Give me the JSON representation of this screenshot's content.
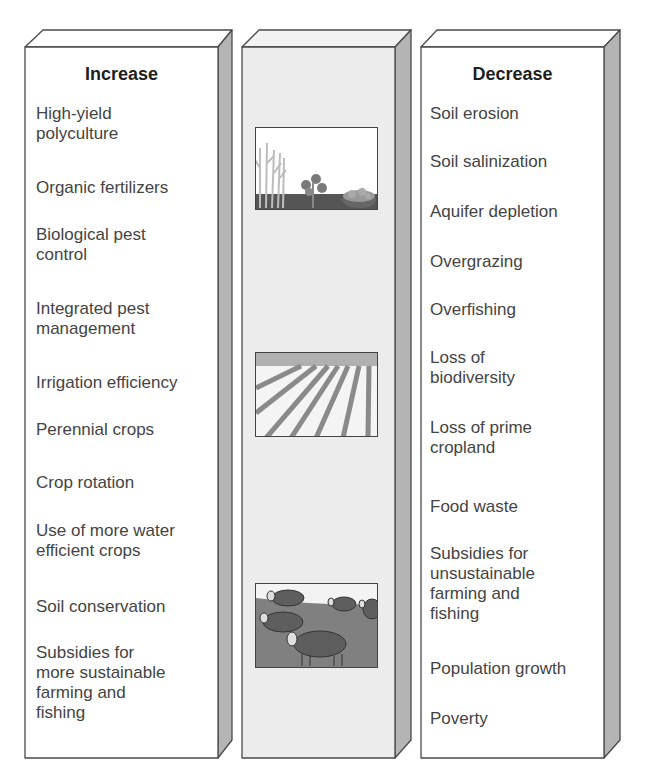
{
  "left_column": {
    "heading": "Increase",
    "items": [
      {
        "text": "High-yield\npolyculture",
        "top": 57
      },
      {
        "text": "Organic fertilizers",
        "top": 131
      },
      {
        "text": "Biological pest\ncontrol",
        "top": 178
      },
      {
        "text": "Integrated pest\nmanagement",
        "top": 252
      },
      {
        "text": "Irrigation efficiency",
        "top": 326
      },
      {
        "text": "Perennial crops",
        "top": 373
      },
      {
        "text": "Crop rotation",
        "top": 426
      },
      {
        "text": "Use of more water\nefficient crops",
        "top": 474
      },
      {
        "text": "Soil conservation",
        "top": 550
      },
      {
        "text": "Subsidies for\nmore sustainable\nfarming and\nfishing",
        "top": 596
      }
    ]
  },
  "middle_column": {
    "images": [
      {
        "name": "crops-illustration",
        "top": 80
      },
      {
        "name": "plowed-field-illustration",
        "top": 305
      },
      {
        "name": "grazing-sheep-illustration",
        "top": 536
      }
    ]
  },
  "right_column": {
    "heading": "Decrease",
    "items": [
      {
        "text": "Soil erosion",
        "top": 57
      },
      {
        "text": "Soil salinization",
        "top": 105
      },
      {
        "text": "Aquifer depletion",
        "top": 155
      },
      {
        "text": "Overgrazing",
        "top": 205
      },
      {
        "text": "Overfishing",
        "top": 253
      },
      {
        "text": "Loss of\nbiodiversity",
        "top": 301
      },
      {
        "text": "Loss of prime\ncropland",
        "top": 371
      },
      {
        "text": "Food waste",
        "top": 450
      },
      {
        "text": "Subsidies for\nunsustainable\nfarming and\nfishing",
        "top": 497
      },
      {
        "text": "Population growth",
        "top": 612
      },
      {
        "text": "Poverty",
        "top": 662
      }
    ]
  },
  "colors": {
    "box_face": "#ffffff",
    "middle_face": "#ececec",
    "side_face": "#b4b4b4",
    "outline": "#4a4a4a"
  }
}
